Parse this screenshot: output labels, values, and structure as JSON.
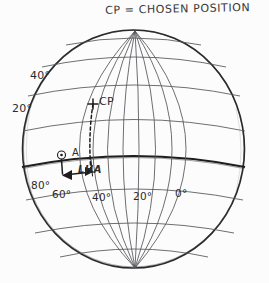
{
  "title": {
    "text": "CP = CHOSEN POSITION"
  },
  "diagram": {
    "name": "globe-lha-diagram",
    "colors": {
      "background": "#fcfcfc",
      "ink": "#3a3a3a",
      "ink_bold": "#1d1d1d",
      "grid": "#55555a"
    },
    "latitude_labels": [
      {
        "text": "40°",
        "x": 30,
        "y": 70
      },
      {
        "text": "20°",
        "x": 12,
        "y": 103
      }
    ],
    "longitude_labels": [
      {
        "text": "80°",
        "x": 31,
        "y": 180
      },
      {
        "text": "60°",
        "x": 52,
        "y": 189
      },
      {
        "text": "40°",
        "x": 92,
        "y": 192
      },
      {
        "text": "20°",
        "x": 133,
        "y": 191
      },
      {
        "text": "0°",
        "x": 175,
        "y": 188
      }
    ],
    "markers": {
      "cp": {
        "label": "CP",
        "label_x": 99,
        "label_y": 96,
        "point_x": 93,
        "point_y": 104
      },
      "observer": {
        "label": "A",
        "label_x": 72,
        "label_y": 148,
        "symbol": "circle-dot",
        "point_x": 62,
        "point_y": 155
      },
      "lha": {
        "label": "LHA",
        "label_x": 78,
        "label_y": 165
      }
    }
  }
}
